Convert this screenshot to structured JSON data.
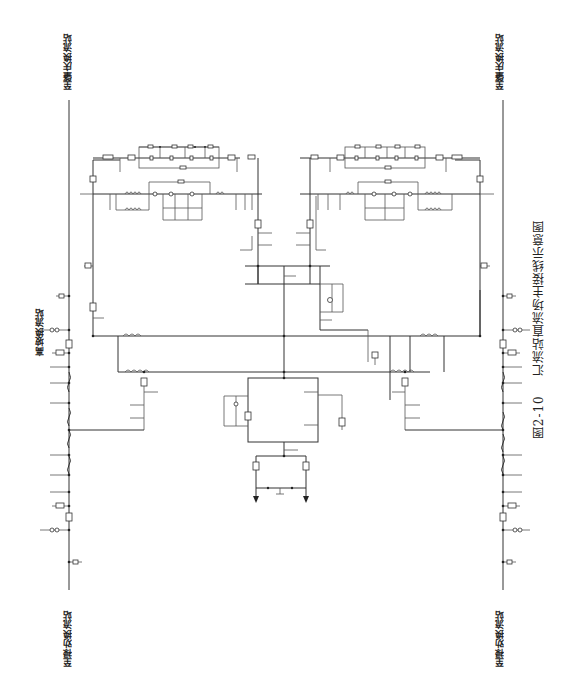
{
  "figure": {
    "number": "图2-10",
    "title": "汇流站直流场主接线示意图"
  },
  "labels": {
    "top_left": "至肇庆换流站",
    "top_right": "至肇庆换流站",
    "bottom_left": "至禄劝换流站",
    "bottom_right": "至禄劝换流站",
    "left_middle": "高坡换流站"
  },
  "diagram": {
    "type": "single-line DC switchyard main wiring diagram",
    "colors": {
      "line": "#333333",
      "background": "#ffffff"
    },
    "components": [
      "DC lines (left and right)",
      "DC filter banks (upper left and upper right)",
      "smoothing reactors",
      "disconnectors / isolating switches",
      "earthing switches",
      "current transformers",
      "neutral bus with grounding electrode"
    ]
  }
}
